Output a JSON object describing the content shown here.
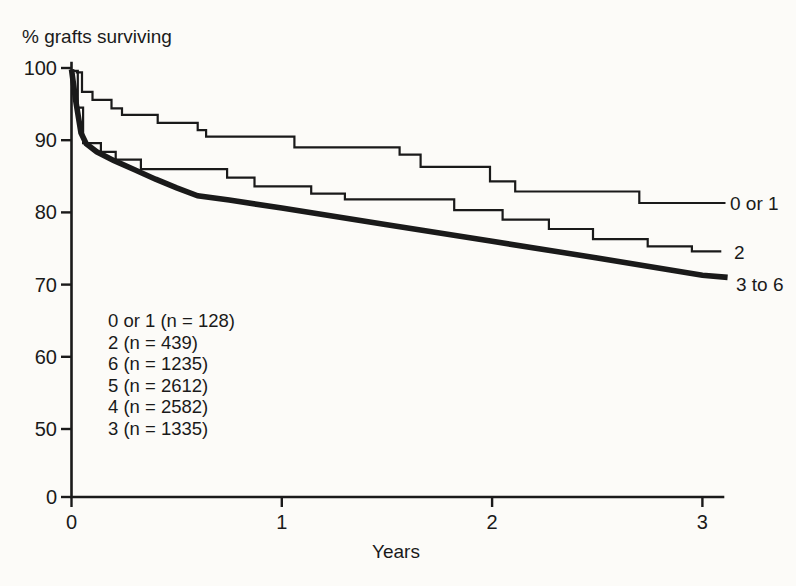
{
  "figure": {
    "title": "% grafts surviving",
    "xlabel": "Years"
  },
  "legend": {
    "lines": [
      "0 or 1 (n = 128)",
      "2 (n = 439)",
      "6 (n = 1235)",
      "5 (n = 2612)",
      "4 (n = 2582)",
      "3 (n = 1335)"
    ]
  },
  "chart_data": {
    "type": "line",
    "subtype": "kaplan-meier-survival-steps",
    "title": "% grafts surviving",
    "xlabel": "Years",
    "ylabel": "",
    "x_ticks": [
      0,
      1,
      2,
      3
    ],
    "y_ticks": [
      100,
      90,
      80,
      70,
      60,
      50,
      0
    ],
    "xlim": [
      0,
      3.1
    ],
    "ylim_displayed": [
      50,
      100
    ],
    "y_axis_break": "axis compressed below 50; 0 drawn one tick-interval below 50",
    "grid": false,
    "legend_position": "inside-lower-left",
    "colors": {
      "ink": "#1a1a1a",
      "background": "#fcfbf8"
    },
    "series": [
      {
        "name": "0 or 1",
        "n": 128,
        "line_weight": "thin",
        "interpolation": "step-after",
        "points": [
          [
            0.02,
            99.4
          ],
          [
            0.05,
            96.7
          ],
          [
            0.1,
            95.6
          ],
          [
            0.19,
            94.4
          ],
          [
            0.24,
            93.5
          ],
          [
            0.41,
            92.4
          ],
          [
            0.6,
            91.4
          ],
          [
            0.64,
            90.5
          ],
          [
            1.06,
            89.0
          ],
          [
            1.56,
            88.0
          ],
          [
            1.66,
            86.3
          ],
          [
            1.99,
            84.3
          ],
          [
            2.11,
            82.9
          ],
          [
            2.7,
            81.3
          ],
          [
            3.11,
            81.3
          ]
        ]
      },
      {
        "name": "2",
        "n": 439,
        "line_weight": "thin",
        "interpolation": "step-after",
        "points": [
          [
            0.0,
            99.6
          ],
          [
            0.03,
            94.5
          ],
          [
            0.055,
            89.6
          ],
          [
            0.14,
            88.4
          ],
          [
            0.21,
            87.3
          ],
          [
            0.33,
            86.0
          ],
          [
            0.74,
            84.8
          ],
          [
            0.87,
            83.6
          ],
          [
            1.14,
            82.6
          ],
          [
            1.3,
            81.8
          ],
          [
            1.82,
            80.3
          ],
          [
            2.05,
            79.0
          ],
          [
            2.27,
            77.7
          ],
          [
            2.48,
            76.3
          ],
          [
            2.74,
            75.3
          ],
          [
            2.95,
            74.6
          ],
          [
            3.09,
            74.6
          ]
        ]
      },
      {
        "name": "3 to 6",
        "line_weight": "thick",
        "interpolation": "linear",
        "points": [
          [
            0.0,
            99.8
          ],
          [
            0.02,
            95.5
          ],
          [
            0.045,
            91.0
          ],
          [
            0.07,
            89.5
          ],
          [
            0.12,
            88.4
          ],
          [
            0.2,
            87.2
          ],
          [
            0.3,
            85.9
          ],
          [
            0.4,
            84.6
          ],
          [
            0.5,
            83.4
          ],
          [
            0.6,
            82.3
          ],
          [
            0.75,
            81.7
          ],
          [
            1.0,
            80.6
          ],
          [
            1.5,
            78.3
          ],
          [
            2.0,
            76.0
          ],
          [
            2.5,
            73.7
          ],
          [
            3.0,
            71.3
          ],
          [
            3.12,
            71.0
          ]
        ]
      }
    ]
  }
}
